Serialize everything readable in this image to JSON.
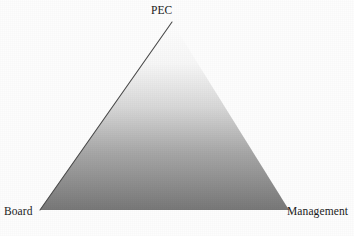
{
  "figure": {
    "type": "triangle-diagram",
    "background_color": "#fdfdfd",
    "width": 354,
    "height": 236
  },
  "chart_data": {
    "type": "diagram",
    "shape": "triangle",
    "title": "",
    "vertices": [
      {
        "id": "apex",
        "label": "PEC",
        "x": 172,
        "y": 22
      },
      {
        "id": "bottom-left",
        "label": "Board",
        "x": 40,
        "y": 210
      },
      {
        "id": "bottom-right",
        "label": "Management",
        "x": 289,
        "y": 210
      }
    ],
    "fill": {
      "style": "linear-gradient",
      "direction": "vertical",
      "stops": [
        {
          "offset": "0%",
          "color": "#fefefe"
        },
        {
          "offset": "22%",
          "color": "#f7f7f7"
        },
        {
          "offset": "45%",
          "color": "#d8d8d8"
        },
        {
          "offset": "70%",
          "color": "#a6a6a6"
        },
        {
          "offset": "100%",
          "color": "#787878"
        }
      ]
    },
    "edges": [
      {
        "id": "upper-left-edge",
        "from": "bottom-left",
        "to": "apex",
        "stroke": "#4a4a4a",
        "stroke_width": 1,
        "visible_outline": true
      },
      {
        "id": "right-edge",
        "from": "apex",
        "to": "bottom-right",
        "stroke": "none",
        "stroke_width": 0,
        "visible_outline": false
      },
      {
        "id": "base-edge",
        "from": "bottom-right",
        "to": "bottom-left",
        "stroke": "none",
        "stroke_width": 0,
        "visible_outline": false
      }
    ],
    "labels": [
      {
        "id": "label-pec",
        "text": "PEC",
        "anchor": "apex",
        "position": "above"
      },
      {
        "id": "label-board",
        "text": "Board",
        "anchor": "bottom-left",
        "position": "below-left"
      },
      {
        "id": "label-management",
        "text": "Management",
        "anchor": "bottom-right",
        "position": "below-right"
      }
    ]
  },
  "labels": {
    "apex": "PEC",
    "bottom_left": "Board",
    "bottom_right": "Management"
  }
}
